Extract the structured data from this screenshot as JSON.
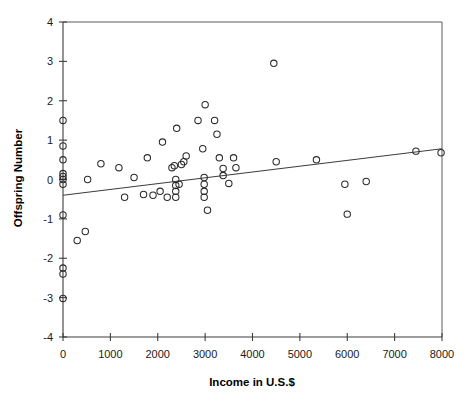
{
  "chart_data": {
    "type": "scatter",
    "title": "",
    "xlabel": "Income in U.S.$",
    "ylabel": "Offspring Number",
    "xlim": [
      0,
      8000
    ],
    "ylim": [
      -4,
      4
    ],
    "grid": false,
    "legend": null,
    "xticks": [
      0,
      1000,
      2000,
      3000,
      4000,
      5000,
      6000,
      7000,
      8000
    ],
    "xtick_labels": [
      "0",
      "1000",
      "2000",
      "3000",
      "4000",
      "5000",
      "6000",
      "7000",
      "8000"
    ],
    "yticks": [
      -4,
      -3,
      -2,
      -1,
      0,
      1,
      2,
      3,
      4
    ],
    "ytick_labels": [
      "-4",
      "-3",
      "-2",
      "-1",
      "0",
      "1",
      "2",
      "3",
      "4"
    ],
    "marker_style": "open-circle",
    "marker_size": 4.2,
    "points": [
      [
        0,
        1.5
      ],
      [
        0,
        0.85
      ],
      [
        0,
        0.5
      ],
      [
        0,
        0.15
      ],
      [
        0,
        0.08
      ],
      [
        0,
        0.0
      ],
      [
        0,
        -0.12
      ],
      [
        0,
        -0.9
      ],
      [
        0,
        -2.25
      ],
      [
        0,
        -2.4
      ],
      [
        0,
        -3.02
      ],
      [
        300,
        -1.55
      ],
      [
        470,
        -1.32
      ],
      [
        520,
        0.0
      ],
      [
        800,
        0.4
      ],
      [
        1180,
        0.3
      ],
      [
        1300,
        -0.45
      ],
      [
        1500,
        0.05
      ],
      [
        1700,
        -0.38
      ],
      [
        1780,
        0.55
      ],
      [
        1900,
        -0.4
      ],
      [
        2050,
        -0.3
      ],
      [
        2100,
        0.95
      ],
      [
        2200,
        -0.45
      ],
      [
        2300,
        0.3
      ],
      [
        2350,
        0.35
      ],
      [
        2380,
        0.0
      ],
      [
        2380,
        -0.15
      ],
      [
        2380,
        -0.3
      ],
      [
        2380,
        -0.45
      ],
      [
        2400,
        1.3
      ],
      [
        2450,
        -0.12
      ],
      [
        2500,
        0.38
      ],
      [
        2550,
        0.45
      ],
      [
        2600,
        0.6
      ],
      [
        2850,
        1.5
      ],
      [
        2950,
        0.78
      ],
      [
        2980,
        0.05
      ],
      [
        2980,
        -0.12
      ],
      [
        2980,
        -0.3
      ],
      [
        2980,
        -0.45
      ],
      [
        3000,
        1.9
      ],
      [
        3050,
        -0.78
      ],
      [
        3200,
        1.5
      ],
      [
        3250,
        1.15
      ],
      [
        3300,
        0.55
      ],
      [
        3380,
        0.28
      ],
      [
        3380,
        0.1
      ],
      [
        3500,
        -0.1
      ],
      [
        3600,
        0.55
      ],
      [
        3650,
        0.3
      ],
      [
        4450,
        2.95
      ],
      [
        4500,
        0.45
      ],
      [
        5350,
        0.5
      ],
      [
        5950,
        -0.12
      ],
      [
        6000,
        -0.88
      ],
      [
        6400,
        -0.05
      ],
      [
        7450,
        0.72
      ],
      [
        7980,
        0.68
      ]
    ],
    "trend_line": {
      "x_start": 0,
      "y_start": -0.4,
      "x_end": 8000,
      "y_end": 0.78
    }
  },
  "caption": {
    "text": ""
  }
}
